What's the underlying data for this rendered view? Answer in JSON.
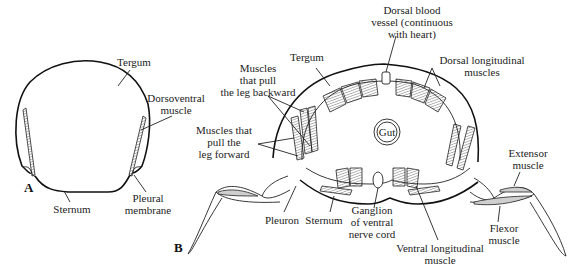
{
  "figure": {
    "panel_a": {
      "panel_label": "A",
      "labels": {
        "tergum": "Tergum",
        "dorsoventral_1": "Dorsoventral",
        "dorsoventral_2": "muscle",
        "sternum": "Sternum",
        "pleural_1": "Pleural",
        "pleural_2": "membrane"
      }
    },
    "panel_b": {
      "panel_label": "B",
      "labels": {
        "tergum": "Tergum",
        "dorsal_vessel_1": "Dorsal blood",
        "dorsal_vessel_2": "vessel (continuous",
        "dorsal_vessel_3": "with heart)",
        "dorsal_long_1": "Dorsal longitudinal",
        "dorsal_long_2": "muscles",
        "backward_1": "Muscles",
        "backward_2": "that pull",
        "backward_3": "the leg backward",
        "forward_1": "Muscles that",
        "forward_2": "pull the",
        "forward_3": "leg forward",
        "gut": "Gut",
        "extensor_1": "Extensor",
        "extensor_2": "muscle",
        "pleuron": "Pleuron",
        "sternum": "Sternum",
        "ganglion_1": "Ganglion",
        "ganglion_2": "of ventral",
        "ganglion_3": "nerve cord",
        "ventral_long_1": "Ventral longitudinal",
        "ventral_long_2": "muscle",
        "flexor_1": "Flexor",
        "flexor_2": "muscle"
      }
    }
  }
}
